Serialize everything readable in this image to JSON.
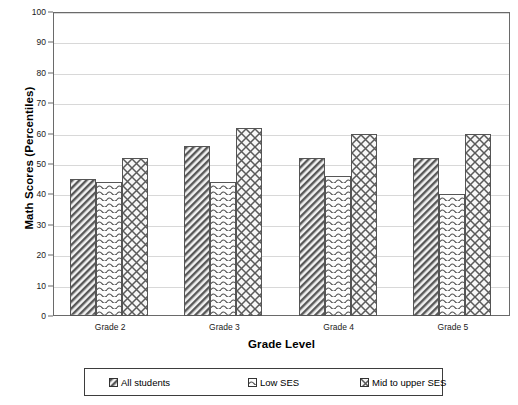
{
  "chart_data": {
    "type": "bar",
    "title": "",
    "subtitle": "",
    "xlabel": "Grade Level",
    "ylabel": "Math Scores (Percentiles)",
    "categories": [
      "Grade 2",
      "Grade 3",
      "Grade 4",
      "Grade 5"
    ],
    "series": [
      {
        "name": "All  students",
        "values": [
          45,
          56,
          52,
          52
        ],
        "pattern": "diagonal-hatch"
      },
      {
        "name": "Low SES",
        "values": [
          44,
          44,
          46,
          40
        ],
        "pattern": "horizontal-wave"
      },
      {
        "name": "Mid to upper SES",
        "values": [
          52,
          62,
          60,
          60
        ],
        "pattern": "diamond-lattice"
      }
    ],
    "ylim": [
      0,
      100
    ],
    "ytick_labels": [
      "100",
      "90",
      "80",
      "70",
      "60",
      "50",
      "40",
      "30",
      "20",
      "10",
      "0"
    ],
    "ytick_values": [
      100,
      90,
      80,
      70,
      60,
      50,
      40,
      30,
      20,
      10,
      0
    ],
    "ytick_interval": 10,
    "grid": true,
    "grid_axis": "y",
    "legend_position": "bottom",
    "legend_border": true,
    "colors": {
      "axis": "#6a6a6a",
      "grid": "#d8d8d8",
      "bar_outline": "#555555",
      "legend_border": "#3d3d3d",
      "text": "#000000",
      "background": "#ffffff"
    }
  }
}
